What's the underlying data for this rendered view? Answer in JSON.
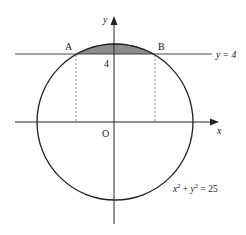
{
  "diagram": {
    "circle_equation": "x² + y² = 25",
    "circle_eq_parts": {
      "x": "x",
      "sup1": "2",
      "plus": " + ",
      "y": "y",
      "sup2": "2",
      "eq": " = 25"
    },
    "line_label": "y = 4",
    "point_a": "A",
    "point_b": "B",
    "origin": "O",
    "x_axis_label": "x",
    "y_axis_label": "y",
    "y_intercept_label": "4",
    "colors": {
      "stroke": "#222222",
      "shaded_region": "#8c8c8c",
      "dashed": "#666666"
    }
  }
}
